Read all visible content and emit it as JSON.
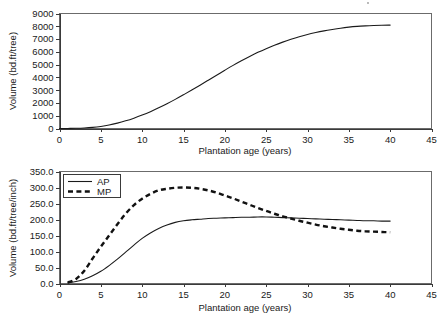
{
  "page": {
    "background_color": "#ffffff",
    "ink_color": "#1a1a1a"
  },
  "chart_data": [
    {
      "id": "top",
      "type": "line",
      "title": "",
      "xlabel": "Plantation age (years)",
      "ylabel": "Volume (bd.ft/tree)",
      "xlim": [
        0,
        45
      ],
      "ylim": [
        0,
        9000
      ],
      "xticks": [
        "0",
        "5",
        "10",
        "15",
        "20",
        "25",
        "30",
        "35",
        "40",
        "45"
      ],
      "xtick_values": [
        0,
        5,
        10,
        15,
        20,
        25,
        30,
        35,
        40,
        45
      ],
      "yticks": [
        "0",
        "1000",
        "2000",
        "3000",
        "4000",
        "5000",
        "6000",
        "7000",
        "8000",
        "9000"
      ],
      "ytick_values": [
        0,
        1000,
        2000,
        3000,
        4000,
        5000,
        6000,
        7000,
        8000,
        9000
      ],
      "grid": false,
      "legend": null,
      "series": [
        {
          "name": "Cumulative volume",
          "style": "solid",
          "color": "#1a1a1a",
          "x": [
            0,
            1,
            2,
            3,
            4,
            5,
            6,
            7,
            8,
            9,
            10,
            11,
            12,
            13,
            14,
            15,
            16,
            17,
            18,
            19,
            20,
            21,
            22,
            23,
            24,
            25,
            26,
            27,
            28,
            29,
            30,
            31,
            32,
            33,
            34,
            35,
            36,
            37,
            38,
            39,
            40
          ],
          "y": [
            0,
            5,
            15,
            40,
            85,
            160,
            270,
            420,
            600,
            810,
            1050,
            1320,
            1620,
            1940,
            2280,
            2640,
            3010,
            3390,
            3780,
            4170,
            4560,
            4940,
            5300,
            5640,
            5960,
            6250,
            6520,
            6760,
            6980,
            7180,
            7360,
            7510,
            7640,
            7750,
            7850,
            7930,
            7990,
            8030,
            8060,
            8080,
            8090
          ]
        }
      ]
    },
    {
      "id": "bottom",
      "type": "line",
      "title": "",
      "xlabel": "Plantation age (years)",
      "ylabel": "Volume (bd.ft/tree/inch)",
      "xlim": [
        0,
        45
      ],
      "ylim": [
        0,
        350
      ],
      "xticks": [
        "0",
        "5",
        "10",
        "15",
        "20",
        "25",
        "30",
        "35",
        "40",
        "45"
      ],
      "xtick_values": [
        0,
        5,
        10,
        15,
        20,
        25,
        30,
        35,
        40,
        45
      ],
      "yticks": [
        "0.0",
        "50.0",
        "100.0",
        "150.0",
        "200.0",
        "250.0",
        "300.0",
        "350.0"
      ],
      "ytick_values": [
        0,
        50,
        100,
        150,
        200,
        250,
        300,
        350
      ],
      "grid": false,
      "legend": {
        "position": "top-left",
        "entries": [
          {
            "label": "AP",
            "style": "solid"
          },
          {
            "label": "MP",
            "style": "dashed"
          }
        ]
      },
      "series": [
        {
          "name": "AP",
          "style": "solid",
          "color": "#1a1a1a",
          "x": [
            1,
            2,
            3,
            4,
            5,
            6,
            7,
            8,
            9,
            10,
            11,
            12,
            13,
            14,
            15,
            16,
            17,
            18,
            19,
            20,
            21,
            22,
            23,
            24,
            25,
            26,
            27,
            28,
            29,
            30,
            31,
            32,
            33,
            34,
            35,
            36,
            37,
            38,
            39,
            40
          ],
          "y": [
            2,
            6,
            13,
            24,
            38,
            56,
            76,
            98,
            120,
            141,
            158,
            172,
            183,
            191,
            196,
            199,
            201,
            203,
            204,
            205,
            206,
            207,
            207,
            208,
            208,
            207,
            206,
            205,
            204,
            203,
            202,
            201,
            200,
            199,
            198,
            197,
            196,
            196,
            195,
            195
          ]
        },
        {
          "name": "MP",
          "style": "dashed",
          "color": "#111111",
          "x": [
            1,
            2,
            3,
            4,
            5,
            6,
            7,
            8,
            9,
            10,
            11,
            12,
            13,
            14,
            15,
            16,
            17,
            18,
            19,
            20,
            21,
            22,
            23,
            24,
            25,
            26,
            27,
            28,
            29,
            30,
            31,
            32,
            33,
            34,
            35,
            36,
            37,
            38,
            39,
            40
          ],
          "y": [
            3,
            14,
            40,
            78,
            115,
            150,
            185,
            218,
            245,
            265,
            280,
            291,
            296,
            299,
            300,
            299,
            296,
            291,
            284,
            275,
            266,
            256,
            246,
            236,
            227,
            218,
            210,
            203,
            196,
            190,
            184,
            179,
            175,
            171,
            168,
            165,
            163,
            162,
            161,
            160
          ]
        }
      ]
    }
  ]
}
